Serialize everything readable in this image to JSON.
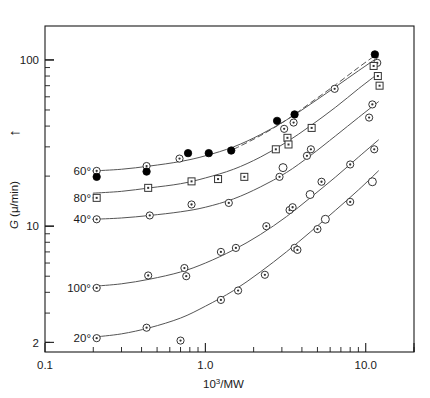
{
  "chart_data": {
    "type": "line",
    "title": "",
    "xlabel": "10^3/MW",
    "xlabel_base": "10",
    "xlabel_exp": "3",
    "xlabel_rest": "/MW",
    "ylabel": "G (μ/min)",
    "ylabel_italic": "G",
    "ylabel_rest": " (μ/min)",
    "xscale": "log",
    "yscale": "log",
    "xlim": [
      0.1,
      20.0
    ],
    "ylim": [
      1.75,
      160
    ],
    "xticklabels": [
      "0.1",
      "1.0",
      "10.0"
    ],
    "xtickvalues": [
      0.1,
      1.0,
      10.0
    ],
    "yticklabels": [
      "2",
      "10",
      "100"
    ],
    "ytickvalues": [
      2,
      10,
      100
    ],
    "grid": false,
    "legend_position": "inline-left-labels",
    "y_axis_arrow": "↑",
    "series": [
      {
        "name": "60°",
        "label": "60°",
        "marker": "circle-dot",
        "label_x": 0.205,
        "label_y": 22.0,
        "curve": [
          [
            0.2,
            21.5
          ],
          [
            0.3,
            22.0
          ],
          [
            0.45,
            23.0
          ],
          [
            0.7,
            24.5
          ],
          [
            1.0,
            26.5
          ],
          [
            1.5,
            30.0
          ],
          [
            2.2,
            35.5
          ],
          [
            3.2,
            43.5
          ],
          [
            4.5,
            54.0
          ],
          [
            6.5,
            69.0
          ],
          [
            9.0,
            86.0
          ],
          [
            12.0,
            104.0
          ]
        ],
        "points": [
          {
            "x": 0.21,
            "y": 21.5,
            "marker": "circle-dot"
          },
          {
            "x": 0.21,
            "y": 19.8,
            "marker": "filled-circle"
          },
          {
            "x": 0.43,
            "y": 23.0,
            "marker": "circle-dot"
          },
          {
            "x": 0.43,
            "y": 21.3,
            "marker": "filled-circle"
          },
          {
            "x": 0.69,
            "y": 25.5,
            "marker": "circle-dot"
          },
          {
            "x": 0.78,
            "y": 27.5,
            "marker": "filled-circle"
          },
          {
            "x": 1.05,
            "y": 27.5,
            "marker": "filled-circle"
          },
          {
            "x": 1.45,
            "y": 28.5,
            "marker": "filled-circle"
          },
          {
            "x": 2.8,
            "y": 43.0,
            "marker": "filled-circle"
          },
          {
            "x": 3.1,
            "y": 38.5,
            "marker": "circle-dot"
          },
          {
            "x": 3.6,
            "y": 47.0,
            "marker": "filled-circle"
          },
          {
            "x": 3.55,
            "y": 42.0,
            "marker": "circle-dot"
          },
          {
            "x": 6.4,
            "y": 67.0,
            "marker": "circle-dot"
          },
          {
            "x": 11.4,
            "y": 108.0,
            "marker": "filled-circle"
          },
          {
            "x": 11.8,
            "y": 96.0,
            "marker": "circle-dot"
          }
        ]
      },
      {
        "name": "80°",
        "label": "80°",
        "marker": "square-dot",
        "label_x": 0.205,
        "label_y": 16.5,
        "curve": [
          [
            0.2,
            15.8
          ],
          [
            0.3,
            16.2
          ],
          [
            0.45,
            17.0
          ],
          [
            0.7,
            18.0
          ],
          [
            1.0,
            19.5
          ],
          [
            1.5,
            22.0
          ],
          [
            2.2,
            26.0
          ],
          [
            3.2,
            32.0
          ],
          [
            4.5,
            40.0
          ],
          [
            6.5,
            52.0
          ],
          [
            9.0,
            67.0
          ],
          [
            12.0,
            83.0
          ]
        ],
        "points": [
          {
            "x": 0.21,
            "y": 14.8,
            "marker": "square-dot"
          },
          {
            "x": 0.44,
            "y": 17.0,
            "marker": "square-dot"
          },
          {
            "x": 0.82,
            "y": 18.6,
            "marker": "square-dot"
          },
          {
            "x": 1.2,
            "y": 19.2,
            "marker": "square-dot"
          },
          {
            "x": 1.75,
            "y": 19.8,
            "marker": "square-dot"
          },
          {
            "x": 2.75,
            "y": 29.0,
            "marker": "square-dot"
          },
          {
            "x": 3.25,
            "y": 34.0,
            "marker": "square-dot"
          },
          {
            "x": 3.3,
            "y": 31.0,
            "marker": "square-dot"
          },
          {
            "x": 4.6,
            "y": 39.0,
            "marker": "square-dot"
          },
          {
            "x": 11.2,
            "y": 92.0,
            "marker": "square-dot"
          },
          {
            "x": 11.9,
            "y": 80.0,
            "marker": "square-dot"
          },
          {
            "x": 12.2,
            "y": 70.0,
            "marker": "square-dot"
          }
        ]
      },
      {
        "name": "40°",
        "label": "40°",
        "marker": "circle-dot",
        "label_x": 0.205,
        "label_y": 11.3,
        "curve": [
          [
            0.2,
            11.0
          ],
          [
            0.3,
            11.2
          ],
          [
            0.45,
            11.6
          ],
          [
            0.7,
            12.2
          ],
          [
            1.0,
            13.0
          ],
          [
            1.5,
            14.6
          ],
          [
            2.2,
            17.2
          ],
          [
            3.2,
            21.0
          ],
          [
            4.5,
            26.5
          ],
          [
            6.5,
            35.0
          ],
          [
            9.0,
            45.0
          ],
          [
            12.0,
            56.0
          ]
        ],
        "points": [
          {
            "x": 0.21,
            "y": 11.0,
            "marker": "circle-dot"
          },
          {
            "x": 0.45,
            "y": 11.6,
            "marker": "circle-dot"
          },
          {
            "x": 0.82,
            "y": 13.5,
            "marker": "circle-dot"
          },
          {
            "x": 1.4,
            "y": 13.8,
            "marker": "circle-dot"
          },
          {
            "x": 2.9,
            "y": 19.8,
            "marker": "circle-dot"
          },
          {
            "x": 3.05,
            "y": 22.5,
            "marker": "open-circle"
          },
          {
            "x": 4.3,
            "y": 26.5,
            "marker": "circle-dot"
          },
          {
            "x": 4.55,
            "y": 29.0,
            "marker": "circle-dot"
          },
          {
            "x": 10.5,
            "y": 45.0,
            "marker": "circle-dot"
          },
          {
            "x": 11.0,
            "y": 54.0,
            "marker": "circle-dot"
          }
        ]
      },
      {
        "name": "100°",
        "label": "100°",
        "marker": "circle-dot",
        "label_x": 0.205,
        "label_y": 4.5,
        "curve": [
          [
            0.2,
            4.35
          ],
          [
            0.3,
            4.5
          ],
          [
            0.45,
            4.8
          ],
          [
            0.7,
            5.3
          ],
          [
            1.0,
            6.0
          ],
          [
            1.5,
            7.2
          ],
          [
            2.2,
            8.9
          ],
          [
            3.2,
            11.4
          ],
          [
            4.5,
            14.8
          ],
          [
            6.5,
            19.8
          ],
          [
            9.0,
            26.0
          ],
          [
            12.0,
            33.0
          ]
        ],
        "points": [
          {
            "x": 0.21,
            "y": 4.25,
            "marker": "circle-dot"
          },
          {
            "x": 0.44,
            "y": 5.05,
            "marker": "circle-dot"
          },
          {
            "x": 0.74,
            "y": 5.6,
            "marker": "circle-dot"
          },
          {
            "x": 0.76,
            "y": 5.0,
            "marker": "circle-dot"
          },
          {
            "x": 1.25,
            "y": 7.0,
            "marker": "circle-dot"
          },
          {
            "x": 1.55,
            "y": 7.4,
            "marker": "circle-dot"
          },
          {
            "x": 2.4,
            "y": 10.0,
            "marker": "circle-dot"
          },
          {
            "x": 3.35,
            "y": 12.5,
            "marker": "circle-dot"
          },
          {
            "x": 3.5,
            "y": 13.0,
            "marker": "circle-dot"
          },
          {
            "x": 4.5,
            "y": 15.5,
            "marker": "open-circle"
          },
          {
            "x": 5.3,
            "y": 18.5,
            "marker": "circle-dot"
          },
          {
            "x": 8.0,
            "y": 23.5,
            "marker": "circle-dot"
          },
          {
            "x": 11.3,
            "y": 29.0,
            "marker": "circle-dot"
          }
        ]
      },
      {
        "name": "20°",
        "label": "20°",
        "marker": "circle-dot",
        "label_x": 0.205,
        "label_y": 2.2,
        "curve": [
          [
            0.2,
            2.15
          ],
          [
            0.3,
            2.25
          ],
          [
            0.45,
            2.45
          ],
          [
            0.7,
            2.8
          ],
          [
            1.0,
            3.3
          ],
          [
            1.5,
            4.1
          ],
          [
            2.2,
            5.3
          ],
          [
            3.2,
            7.0
          ],
          [
            4.5,
            9.2
          ],
          [
            6.5,
            12.5
          ],
          [
            9.0,
            16.5
          ],
          [
            12.0,
            21.5
          ]
        ],
        "points": [
          {
            "x": 0.21,
            "y": 2.12,
            "marker": "circle-dot"
          },
          {
            "x": 0.43,
            "y": 2.45,
            "marker": "circle-dot"
          },
          {
            "x": 0.7,
            "y": 2.05,
            "marker": "circle-dot"
          },
          {
            "x": 1.25,
            "y": 3.6,
            "marker": "circle-dot"
          },
          {
            "x": 1.6,
            "y": 4.1,
            "marker": "circle-dot"
          },
          {
            "x": 2.35,
            "y": 5.1,
            "marker": "circle-dot"
          },
          {
            "x": 3.6,
            "y": 7.4,
            "marker": "circle-dot"
          },
          {
            "x": 3.75,
            "y": 7.2,
            "marker": "circle-dot"
          },
          {
            "x": 5.0,
            "y": 9.6,
            "marker": "circle-dot"
          },
          {
            "x": 5.6,
            "y": 11.0,
            "marker": "open-circle"
          },
          {
            "x": 8.0,
            "y": 14.0,
            "marker": "circle-dot"
          },
          {
            "x": 11.0,
            "y": 18.5,
            "marker": "open-circle"
          }
        ]
      }
    ],
    "dashed_curve": {
      "name": "dashed-upper",
      "style": "dashed",
      "points": [
        [
          1.5,
          29.0
        ],
        [
          2.2,
          35.0
        ],
        [
          3.2,
          43.5
        ],
        [
          4.5,
          55.0
        ],
        [
          6.5,
          71.0
        ],
        [
          9.0,
          90.0
        ],
        [
          12.0,
          110.0
        ]
      ]
    },
    "colors": {
      "axis": "#1a1a1a",
      "curve": "#555555",
      "marker_stroke": "#333333",
      "marker_fill": "#000000",
      "background": "#ffffff"
    }
  }
}
